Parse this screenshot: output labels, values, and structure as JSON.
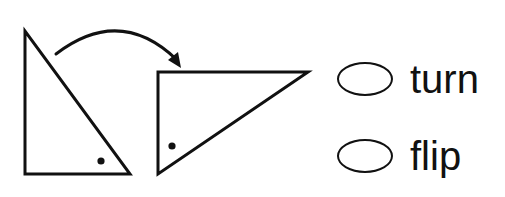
{
  "question": {
    "figure": {
      "before_shape": "right-triangle",
      "after_shape": "right-triangle",
      "transformation_arrow": "curved-arrow",
      "marker": "dot"
    },
    "options": [
      {
        "id": "turn",
        "label": "turn",
        "selected": false
      },
      {
        "id": "flip",
        "label": "flip",
        "selected": false
      }
    ]
  },
  "colors": {
    "ink": "#111111",
    "background": "#ffffff"
  }
}
